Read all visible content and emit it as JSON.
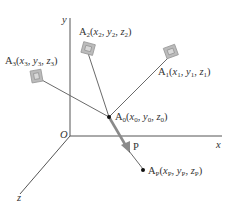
{
  "diagram": {
    "axes": {
      "x_label": "x",
      "y_label": "y",
      "z_label": "z",
      "origin_label": "O"
    },
    "points": {
      "A0": {
        "label": "A",
        "sub": "0",
        "coords": [
          "x",
          "0",
          "y",
          "0",
          "z",
          "0"
        ]
      },
      "A1": {
        "label": "A",
        "sub": "1",
        "coords": [
          "x",
          "1",
          "y",
          "1",
          "z",
          "1"
        ]
      },
      "A2": {
        "label": "A",
        "sub": "2",
        "coords": [
          "x",
          "2",
          "y",
          "2",
          "z",
          "2"
        ]
      },
      "A3": {
        "label": "A",
        "sub": "3",
        "coords": [
          "x",
          "3",
          "y",
          "3",
          "z",
          "3"
        ]
      },
      "AP": {
        "label": "A",
        "sub": "P",
        "coords": [
          "x",
          "P",
          "y",
          "P",
          "z",
          "P"
        ]
      }
    },
    "force_label": "P",
    "colors": {
      "axis": "#555555",
      "cable": "#6a6a6a",
      "arrow": "#8a8a8a",
      "anchor": "#b8b8b8",
      "point": "#111111"
    }
  }
}
